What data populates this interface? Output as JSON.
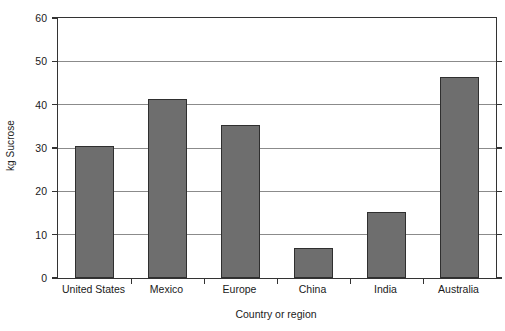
{
  "chart_data": {
    "type": "bar",
    "title": "",
    "xlabel": "Country or region",
    "ylabel": "kg Sucrose",
    "categories": [
      "United States",
      "Mexico",
      "Europe",
      "China",
      "India",
      "Australia"
    ],
    "values": [
      30.4,
      41.4,
      35.2,
      6.9,
      15.2,
      46.5
    ],
    "ylim": [
      0,
      60
    ],
    "ytick_labels": [
      "0",
      "10",
      "20",
      "30",
      "40",
      "50",
      "60"
    ],
    "ytick_values": [
      0,
      10,
      20,
      30,
      40,
      50,
      60
    ],
    "grid": true,
    "legend": "none",
    "series_name": "kg Sucrose",
    "bar_color": "#6e6e6e",
    "bar_edge_color": "#2f2f2f",
    "axis_color": "#333333",
    "gridline_color": "#8b8b8b",
    "background_color": "#ffffff"
  }
}
